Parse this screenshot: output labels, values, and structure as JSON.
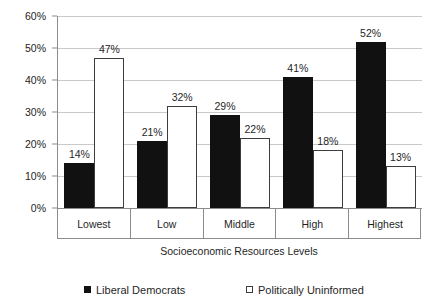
{
  "chart_data": {
    "type": "bar",
    "title": "",
    "subtitle": "",
    "xlabel": "Socioeconomic Resources Levels",
    "ylabel": "",
    "ylim": [
      0,
      60
    ],
    "ytick_values": [
      0,
      10,
      20,
      30,
      40,
      50,
      60
    ],
    "ytick_labels": [
      "0%",
      "10%",
      "20%",
      "30%",
      "40%",
      "50%",
      "60%"
    ],
    "grid": true,
    "legend_position": "bottom",
    "categories": [
      "Lowest",
      "Low",
      "Middle",
      "High",
      "Highest"
    ],
    "series": [
      {
        "name": "Liberal Democrats",
        "color": "#111111",
        "style": "filled",
        "values": [
          14,
          21,
          29,
          41,
          52
        ],
        "labels": [
          "14%",
          "21%",
          "29%",
          "41%",
          "52%"
        ]
      },
      {
        "name": "Politically Uninformed",
        "color": "#ffffff",
        "style": "outlined",
        "values": [
          47,
          32,
          22,
          18,
          13
        ],
        "labels": [
          "47%",
          "32%",
          "22%",
          "18%",
          "13%"
        ]
      }
    ]
  },
  "legend": {
    "items": [
      {
        "label": "Liberal Democrats",
        "swatch": "filled-black-square"
      },
      {
        "label": "Politically Uninformed",
        "swatch": "outlined-white-square"
      }
    ]
  },
  "axis": {
    "x_title": "Socioeconomic Resources Levels"
  },
  "colors": {
    "series_dark": "#111111",
    "series_light": "#ffffff",
    "series_light_border": "#3d3d3d",
    "gridline": "#c9c9c9",
    "axis_line": "#8c8c8c",
    "text": "#1f1f1f",
    "background": "#ffffff"
  }
}
